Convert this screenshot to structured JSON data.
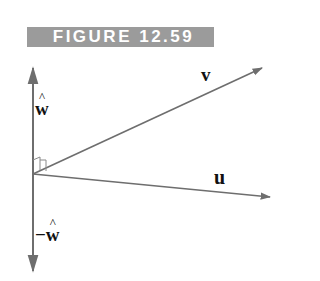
{
  "figure": {
    "caption": "FIGURE 12.59",
    "banner_color": "#9b9b9b",
    "banner_text_color": "#ffffff"
  },
  "diagram": {
    "line_color": "#6e6e6e",
    "origin": [
      33,
      174
    ],
    "vectors": [
      {
        "name": "v",
        "label": "v",
        "tip": [
          263,
          68
        ]
      },
      {
        "name": "u",
        "label": "u",
        "tip": [
          271,
          197
        ]
      },
      {
        "name": "w_hat",
        "label": "w",
        "tip": [
          33,
          67
        ]
      },
      {
        "name": "neg_w_hat",
        "label": "−w",
        "tip": [
          33,
          272
        ]
      }
    ],
    "labels": {
      "v": "v",
      "u": "u",
      "w_hat": "w",
      "neg_w_hat_sign": "−",
      "neg_w_hat": "w"
    },
    "right_angle_markers": 2
  }
}
